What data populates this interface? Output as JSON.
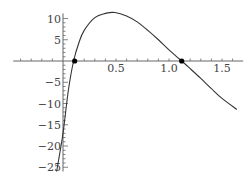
{
  "chart_data": {
    "type": "line",
    "title": "",
    "xlabel": "",
    "ylabel": "",
    "xlim": [
      -0.47,
      1.7
    ],
    "ylim": [
      -27,
      13
    ],
    "grid": false,
    "legend": null,
    "x_ticks": [
      0.5,
      1.0,
      1.5
    ],
    "x_tick_labels": [
      "0.5",
      "1.0",
      "1.5"
    ],
    "y_ticks": [
      10,
      5,
      -5,
      -10,
      -15,
      -20,
      -25
    ],
    "y_tick_labels": [
      "10",
      "5",
      "−5",
      "−10",
      "−15",
      "−20",
      "−25"
    ],
    "series": [
      {
        "name": "f(x)",
        "color": "#333333",
        "x": [
          -0.06,
          0.0,
          0.05,
          0.1,
          0.15,
          0.2,
          0.3,
          0.4,
          0.49,
          0.6,
          0.7,
          0.8,
          0.9,
          1.0,
          1.12,
          1.2,
          1.3,
          1.4,
          1.5,
          1.64
        ],
        "y": [
          -26,
          -17,
          -7,
          0,
          4.3,
          7.2,
          10.2,
          11.2,
          11.4,
          10.6,
          9.2,
          7.2,
          5.0,
          2.6,
          0,
          -1.8,
          -4.1,
          -6.5,
          -8.8,
          -11.4
        ]
      }
    ],
    "points": [
      {
        "x": 0.11,
        "y": 0,
        "label": "root-1"
      },
      {
        "x": 1.12,
        "y": 0,
        "label": "root-2"
      }
    ]
  }
}
